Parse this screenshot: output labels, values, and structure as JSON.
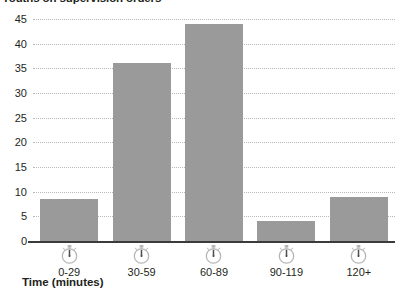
{
  "chart_data": {
    "type": "bar",
    "title": "Youths on supervision orders",
    "xlabel": "Time (minutes)",
    "ylabel": "",
    "categories": [
      "0-29",
      "30-59",
      "60-89",
      "90-119",
      "120+"
    ],
    "values": [
      8.5,
      36,
      44,
      4,
      9
    ],
    "ylim": [
      0,
      45
    ],
    "yticks": [
      0,
      5,
      10,
      15,
      20,
      25,
      30,
      35,
      40,
      45
    ],
    "ytick_labels": [
      "0",
      "5",
      "10",
      "15",
      "20",
      "25",
      "30",
      "35",
      "40",
      "45"
    ],
    "grid": true,
    "legend": false,
    "series": [
      {
        "name": "Youths on supervision orders",
        "values": [
          8.5,
          36,
          44,
          4,
          9
        ],
        "color": "#9a9a9a"
      }
    ],
    "category_icons": [
      "stopwatch-icon",
      "stopwatch-icon",
      "stopwatch-icon",
      "stopwatch-icon",
      "stopwatch-icon"
    ],
    "colors": {
      "bar": "#9a9a9a",
      "axis": "#3b3b3b",
      "gridline": "#b8b8b8",
      "text": "#231f20",
      "background": "#ffffff"
    }
  }
}
